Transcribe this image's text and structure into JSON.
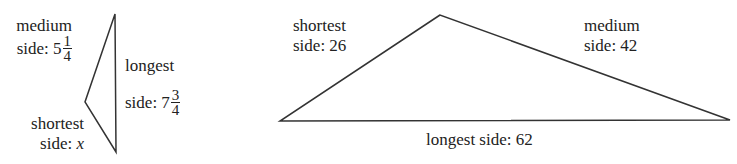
{
  "triangles": [
    {
      "id": "left",
      "vertices": [
        [
          115,
          14
        ],
        [
          85,
          102
        ],
        [
          116,
          152
        ]
      ],
      "sides": {
        "medium": {
          "label": "medium",
          "prefix": "side: ",
          "whole": "5",
          "numerator": "1",
          "denominator": "4"
        },
        "longest": {
          "label": "longest",
          "prefix": "side: ",
          "whole": "7",
          "numerator": "3",
          "denominator": "4"
        },
        "shortest": {
          "label": "shortest",
          "prefix": "side: ",
          "variable": "x"
        }
      }
    },
    {
      "id": "right",
      "vertices": [
        [
          440,
          15
        ],
        [
          280,
          121
        ],
        [
          730,
          120
        ]
      ],
      "sides": {
        "shortest": {
          "label": "shortest",
          "value": "side: 26"
        },
        "medium": {
          "label": "medium",
          "value": "side: 42"
        },
        "longest": {
          "value": "longest side: 62"
        }
      }
    }
  ],
  "colors": {
    "stroke": "#333333",
    "text": "#222222",
    "background": "#ffffff"
  }
}
